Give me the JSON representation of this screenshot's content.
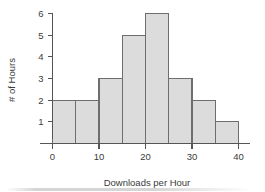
{
  "chart_data": {
    "type": "bar",
    "title": "",
    "xlabel": "Downloads per Hour",
    "ylabel": "# of Hours",
    "bin_edges": [
      0,
      5,
      10,
      15,
      20,
      25,
      30,
      35,
      40
    ],
    "categories": [
      "0-5",
      "5-10",
      "10-15",
      "15-20",
      "20-25",
      "25-30",
      "30-35",
      "35-40"
    ],
    "values": [
      2,
      2,
      3,
      5,
      6,
      3,
      2,
      1
    ],
    "xlim": [
      0,
      40
    ],
    "ylim": [
      0,
      6
    ],
    "xticks": [
      0,
      10,
      20,
      30,
      40
    ],
    "yticks": [
      1,
      2,
      3,
      4,
      5,
      6
    ],
    "xtick_labels": [
      "0",
      "10",
      "20",
      "30",
      "40"
    ],
    "ytick_labels": [
      "1",
      "2",
      "3",
      "4",
      "5",
      "6"
    ],
    "grid": false,
    "legend": false,
    "bar_fill_color": "#dcdcdc",
    "bar_edge_color": "#6e6e6e",
    "axis_color": "#555555",
    "background_color": "#ffffff",
    "text_color": "#3a3a3a"
  }
}
